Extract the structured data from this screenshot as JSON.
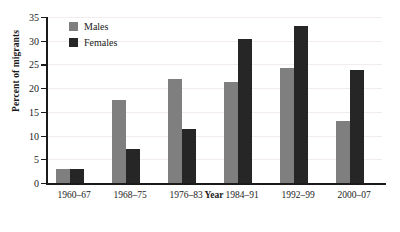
{
  "chart_data": {
    "type": "bar",
    "title": "",
    "xlabel": "Year",
    "ylabel": "Percent of migrants",
    "categories": [
      "1960–67",
      "1968–75",
      "1976–83",
      "1984–91",
      "1992–99",
      "2000–07"
    ],
    "series": [
      {
        "name": "Males",
        "color": "#7f7f7f",
        "values": [
          3,
          17.5,
          22,
          21.3,
          24.3,
          13
        ]
      },
      {
        "name": "Females",
        "color": "#262626",
        "values": [
          3,
          7.2,
          11.3,
          30.3,
          33.2,
          23.8
        ]
      }
    ],
    "ylim": [
      0,
      35
    ],
    "yticks": [
      0,
      5,
      10,
      15,
      20,
      25,
      30,
      35
    ],
    "ytick_labels": [
      "0",
      "5",
      "10",
      "15",
      "20",
      "25",
      "30",
      "35"
    ],
    "grid": true,
    "legend_position": "top-left"
  }
}
